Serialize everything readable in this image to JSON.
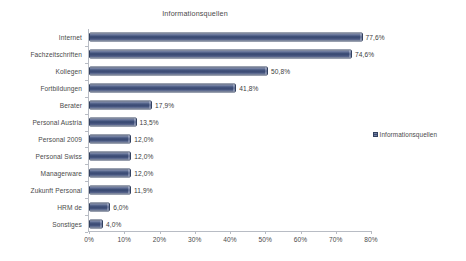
{
  "chart_data": {
    "type": "bar",
    "orientation": "horizontal",
    "title": "Informationsquellen",
    "xlabel": "",
    "ylabel": "",
    "xlim": [
      0,
      80
    ],
    "xticks": [
      "0%",
      "10%",
      "20%",
      "30%",
      "40%",
      "50%",
      "60%",
      "70%",
      "80%"
    ],
    "xtick_values": [
      0,
      10,
      20,
      30,
      40,
      50,
      60,
      70,
      80
    ],
    "grid": false,
    "legend": {
      "position": "right",
      "entries": [
        "Informationsquellen"
      ],
      "marker_color": "#3e4f78"
    },
    "bar_color": "#3e4f78",
    "categories": [
      "Internet",
      "Fachzeitschriften",
      "Kollegen",
      "Fortbildungen",
      "Berater",
      "Personal Austria",
      "Personal 2009",
      "Personal Swiss",
      "Managerware",
      "Zukunft Personal",
      "HRM de",
      "Sonstiges"
    ],
    "values": [
      77.6,
      74.6,
      50.8,
      41.8,
      17.9,
      13.5,
      12.0,
      12.0,
      12.0,
      11.9,
      6.0,
      4.0
    ],
    "data_labels": [
      "77,6%",
      "74,6%",
      "50,8%",
      "41,8%",
      "17,9%",
      "13,5%",
      "12,0%",
      "12,0%",
      "12,0%",
      "11,9%",
      "6,0%",
      "4,0%"
    ],
    "series": [
      {
        "name": "Informationsquellen",
        "values": [
          77.6,
          74.6,
          50.8,
          41.8,
          17.9,
          13.5,
          12.0,
          12.0,
          12.0,
          11.9,
          6.0,
          4.0
        ]
      }
    ]
  }
}
